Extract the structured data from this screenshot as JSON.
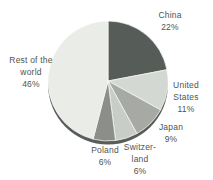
{
  "figure": {
    "background": "#ffffff",
    "text_color": "#50544e"
  },
  "chart_data": {
    "type": "pie",
    "title": "",
    "unit": "%",
    "direction": "clockwise",
    "start_angle_deg": 0,
    "labels_position": "outside",
    "legend": "none",
    "effect": "3d-depth-rim",
    "depth_color": "#575d59",
    "slice_border_color": "#ffffff",
    "categories": [
      "China",
      "United States",
      "Japan",
      "Switzerland",
      "Poland",
      "Rest of the world"
    ],
    "values": [
      22,
      11,
      9,
      6,
      6,
      46
    ],
    "slices": [
      {
        "name": "China",
        "value": 22,
        "color": "#565c58"
      },
      {
        "name": "United States",
        "value": 11,
        "color": "#d4d8d2"
      },
      {
        "name": "Japan",
        "value": 9,
        "color": "#a6a9a4"
      },
      {
        "name": "Switzerland",
        "value": 6,
        "color": "#c9cdc7"
      },
      {
        "name": "Poland",
        "value": 6,
        "color": "#8b8e89"
      },
      {
        "name": "Rest of the world",
        "value": 46,
        "color": "#eaece7"
      }
    ]
  },
  "labels": {
    "china": "China\n22%",
    "united_states": "United\nStates\n11%",
    "japan": "Japan\n9%",
    "switzerland": "Switzer-\nland\n6%",
    "poland": "Poland\n6%",
    "rest_of_world": "Rest of the\nworld\n46%"
  }
}
